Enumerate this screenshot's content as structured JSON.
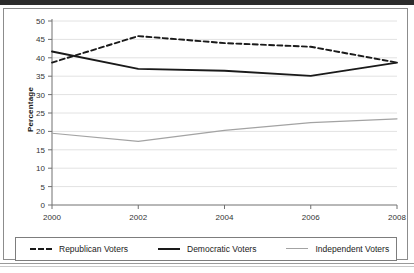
{
  "chart_data": {
    "type": "line",
    "title": "",
    "xlabel": "",
    "ylabel": "Percentage",
    "x": [
      2000,
      2002,
      2004,
      2006,
      2008
    ],
    "categories": [
      "2000",
      "2002",
      "2004",
      "2006",
      "2008"
    ],
    "xtick_labels": [
      "2000",
      "2002",
      "2004",
      "2006",
      "2008"
    ],
    "ytick_labels": [
      "0",
      "5",
      "10",
      "15",
      "20",
      "25",
      "30",
      "35",
      "40",
      "45",
      "50"
    ],
    "ylim": [
      0,
      50
    ],
    "xlim": [
      2000,
      2008
    ],
    "ytick_step": 5,
    "grid": true,
    "grid_axis": "y",
    "legend_position": "bottom",
    "series": [
      {
        "name": "Republican Voters",
        "style": "dashed",
        "color": "#1a1a1a",
        "values": [
          38.7,
          45.9,
          44.0,
          43.0,
          38.7
        ]
      },
      {
        "name": "Democratic Voters",
        "style": "solid",
        "color": "#1a1a1a",
        "values": [
          41.7,
          37.0,
          36.5,
          35.1,
          38.7
        ]
      },
      {
        "name": "Independent Voters",
        "style": "solid-thin",
        "color": "#a3a3a3",
        "values": [
          19.5,
          17.3,
          20.3,
          22.4,
          23.4
        ]
      }
    ]
  },
  "legend": {
    "items": [
      {
        "label": "Republican Voters"
      },
      {
        "label": "Democratic Voters"
      },
      {
        "label": "Independent Voters"
      }
    ]
  },
  "axis": {
    "y_title": "Percentage"
  },
  "colors": {
    "frame": "#8c8c8c",
    "axis": "#707070",
    "grid": "#e2e2e2",
    "series_dark": "#1a1a1a",
    "series_gray": "#a3a3a3",
    "top_band": "#2b2b2b"
  }
}
